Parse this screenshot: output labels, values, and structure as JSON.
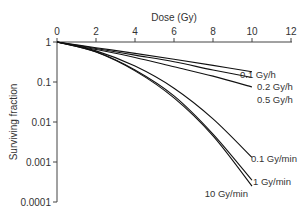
{
  "chart_data": {
    "type": "line",
    "title": "",
    "xlabel": "Dose (Gy)",
    "ylabel": "Surviving fraction",
    "x_axis_position": "top",
    "xlim": [
      0,
      12
    ],
    "ylim": [
      0.0001,
      1
    ],
    "yscale": "log",
    "grid": false,
    "x_ticks": [
      0,
      2,
      4,
      6,
      8,
      10,
      12
    ],
    "x_tick_labels": [
      "0",
      "2",
      "4",
      "6",
      "8",
      "10",
      "12"
    ],
    "y_ticks": [
      1,
      0.1,
      0.01,
      0.001,
      0.0001
    ],
    "y_tick_labels": [
      "1",
      "0.1",
      "0.01",
      "0.001",
      "0.0001"
    ],
    "legend": "inline labels at curve ends",
    "series": [
      {
        "name": "0.1 Gy/h",
        "x": [
          0,
          2,
          4,
          6,
          8,
          10
        ],
        "values": [
          1,
          0.72,
          0.52,
          0.37,
          0.26,
          0.18
        ]
      },
      {
        "name": "0.2 Gy/h",
        "x": [
          0,
          2,
          4,
          6,
          8,
          10
        ],
        "values": [
          1,
          0.69,
          0.47,
          0.32,
          0.2,
          0.13
        ]
      },
      {
        "name": "0.5 Gy/h",
        "x": [
          0,
          2,
          4,
          6,
          8,
          10
        ],
        "values": [
          1,
          0.65,
          0.41,
          0.24,
          0.14,
          0.075
        ]
      },
      {
        "name": "0.1 Gy/min",
        "x": [
          0,
          2,
          4,
          6,
          8,
          10
        ],
        "values": [
          1,
          0.6,
          0.25,
          0.07,
          0.012,
          0.0013
        ]
      },
      {
        "name": "1 Gy/min",
        "x": [
          0,
          2,
          4,
          6,
          8,
          10
        ],
        "values": [
          1,
          0.57,
          0.2,
          0.045,
          0.005,
          0.00035
        ]
      },
      {
        "name": "10 Gy/min",
        "x": [
          0,
          2,
          4,
          6,
          8,
          10
        ],
        "values": [
          1,
          0.56,
          0.19,
          0.04,
          0.0045,
          0.00025
        ]
      }
    ]
  }
}
